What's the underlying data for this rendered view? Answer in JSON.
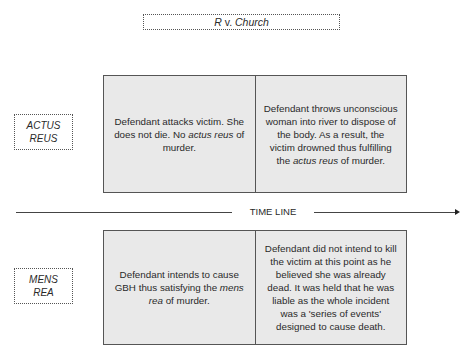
{
  "title": {
    "case_letter": "R",
    "case_connector": " v. ",
    "case_name": "Church"
  },
  "labels": {
    "actus_reus": [
      "ACTUS",
      "REUS"
    ],
    "mens_rea": [
      "MENS",
      "REA"
    ]
  },
  "timeline": {
    "label": "TIME LINE"
  },
  "actus_reus_row": {
    "cells": [
      {
        "pre": "Defendant attacks victim. She does not die. No ",
        "em": "actus reus",
        "post": " of murder."
      },
      {
        "pre": "Defendant throws unconscious woman into river to dispose of the body. As a result, the victim drowned thus fulfilling the ",
        "em": "actus reus",
        "post": " of murder."
      }
    ]
  },
  "mens_rea_row": {
    "cells": [
      {
        "pre": "Defendant intends to cause GBH thus satisfying the ",
        "em": "mens rea",
        "post": " of murder."
      },
      {
        "pre": "Defendant did not intend to kill the victim at this point as he believed she was already dead. It was held that he was liable as the whole incident was a 'series of events' designed to cause death.",
        "em": "",
        "post": ""
      }
    ]
  },
  "colors": {
    "cell_fill": "#e9e9e9",
    "border": "#555555",
    "text": "#2a2a2a"
  }
}
